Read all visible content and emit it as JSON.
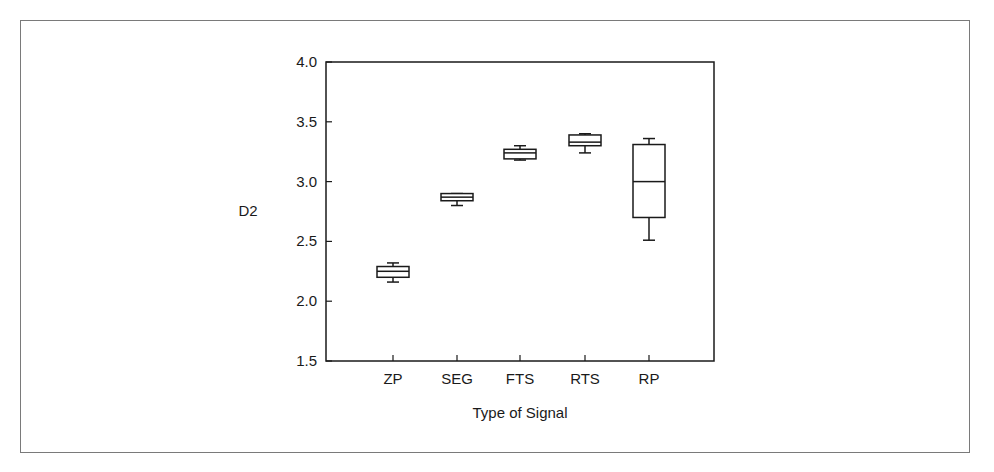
{
  "chart_data": {
    "type": "box",
    "title": "",
    "xlabel": "Type of Signal",
    "ylabel": "D2",
    "ylim": [
      1.5,
      4.0
    ],
    "yticks": [
      "1.5",
      "2.0",
      "2.5",
      "3.0",
      "3.5",
      "4.0"
    ],
    "categories": [
      "ZP",
      "SEG",
      "FTS",
      "RTS",
      "RP"
    ],
    "boxes": [
      {
        "label": "ZP",
        "whisker_low": 2.16,
        "q1": 2.2,
        "median": 2.25,
        "q3": 2.29,
        "whisker_high": 2.32
      },
      {
        "label": "SEG",
        "whisker_low": 2.8,
        "q1": 2.84,
        "median": 2.87,
        "q3": 2.9,
        "whisker_high": 2.9
      },
      {
        "label": "FTS",
        "whisker_low": 3.18,
        "q1": 3.19,
        "median": 3.24,
        "q3": 3.27,
        "whisker_high": 3.3
      },
      {
        "label": "RTS",
        "whisker_low": 3.24,
        "q1": 3.3,
        "median": 3.33,
        "q3": 3.39,
        "whisker_high": 3.4
      },
      {
        "label": "RP",
        "whisker_low": 2.51,
        "q1": 2.7,
        "median": 3.0,
        "q3": 3.31,
        "whisker_high": 3.36
      }
    ],
    "grid": false,
    "legend": null
  }
}
